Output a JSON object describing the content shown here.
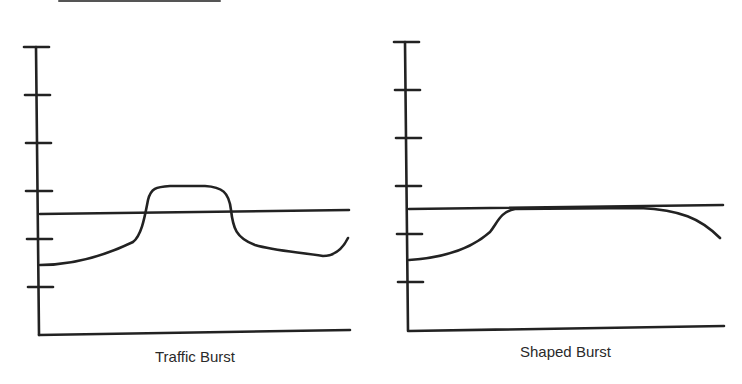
{
  "diagram": {
    "ink_color": "#222222",
    "panels": [
      {
        "id": "traffic-burst",
        "caption": "Traffic Burst",
        "y_axis_ticks": 6,
        "has_threshold_line": true,
        "curve_description": "Traffic rises from below the threshold line, bursts above it in a plateau, drops back below, then rises at the end"
      },
      {
        "id": "shaped-burst",
        "caption": "Shaped Burst",
        "y_axis_ticks": 6,
        "has_threshold_line": true,
        "curve_description": "Traffic rises up to the threshold line and is held flat along it, then gradually falls off"
      }
    ]
  }
}
